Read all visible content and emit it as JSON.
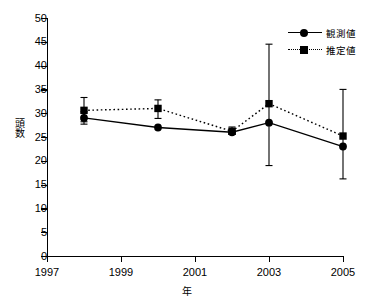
{
  "chart_data": {
    "type": "line",
    "title": "",
    "xlabel": "年",
    "ylabel": "頭数",
    "xlim": [
      1997,
      2005
    ],
    "ylim": [
      0,
      50
    ],
    "ytick_step": 5,
    "grid": false,
    "legend_position": "top-right",
    "xticks": [
      "1997",
      "1999",
      "2001",
      "2003",
      "2005"
    ],
    "yticks": [
      "0",
      "5",
      "10",
      "15",
      "20",
      "25",
      "30",
      "35",
      "40",
      "45",
      "50"
    ],
    "x": [
      1998,
      2000,
      2002,
      2003,
      2005
    ],
    "series": [
      {
        "name": "観測値",
        "marker": "circle",
        "linestyle": "solid",
        "color": "#000000",
        "values": [
          29.0,
          27.0,
          26.0,
          28.0,
          23.0
        ],
        "err_low": [
          27.7,
          27.0,
          25.6,
          19.0,
          16.2
        ],
        "err_high": [
          30.3,
          27.0,
          26.4,
          44.5,
          35.0
        ]
      },
      {
        "name": "推定値",
        "marker": "square",
        "linestyle": "dotted",
        "color": "#000000",
        "values": [
          30.6,
          31.0,
          26.2,
          32.0,
          25.2
        ],
        "err_low": [
          28.2,
          28.9,
          25.6,
          32.0,
          25.2
        ],
        "err_high": [
          33.3,
          32.8,
          27.1,
          32.0,
          25.2
        ]
      }
    ]
  },
  "legend": {
    "items": [
      {
        "label": "観測値"
      },
      {
        "label": "推定値"
      }
    ]
  }
}
